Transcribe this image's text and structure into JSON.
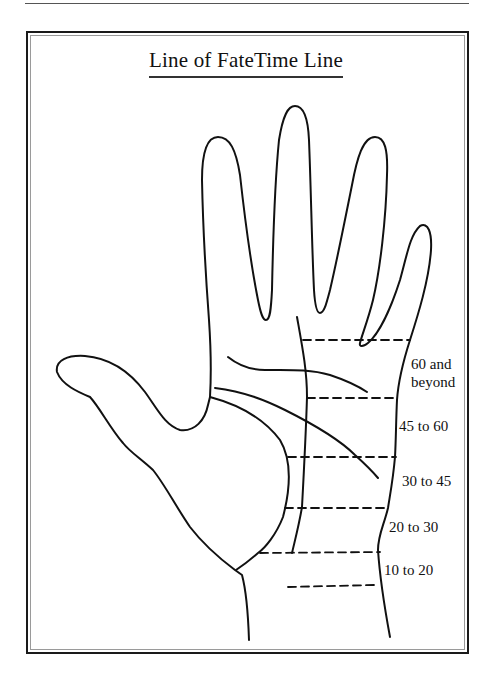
{
  "title": "Line of FateTime Line",
  "diagram": {
    "age_bands": [
      {
        "label_line1": "60 and",
        "label_line2": "beyond"
      },
      {
        "label": "45 to 60"
      },
      {
        "label": "30 to 45"
      },
      {
        "label": "20 to 30"
      },
      {
        "label": "10 to 20"
      }
    ]
  },
  "colors": {
    "ink": "#111111",
    "frame": "#1a1a1a",
    "frame_inner": "#9a9a9a",
    "background": "#ffffff"
  }
}
